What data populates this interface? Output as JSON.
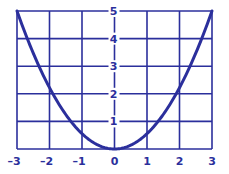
{
  "colors": {
    "ink": "#2b2f9c",
    "background": "#ffffff"
  },
  "chart_data": {
    "type": "line",
    "title": "",
    "xlabel": "",
    "ylabel": "",
    "xlim": [
      -3,
      3
    ],
    "ylim": [
      0,
      5
    ],
    "grid": true,
    "x_ticks": [
      "-3",
      "-2",
      "-1",
      "0",
      "1",
      "2",
      "3"
    ],
    "y_ticks": [
      "1",
      "2",
      "3",
      "4",
      "5"
    ],
    "series": [
      {
        "name": "y = (5/9)x^2",
        "x": [
          -3,
          -2.5,
          -2,
          -1.5,
          -1,
          -0.5,
          0,
          0.5,
          1,
          1.5,
          2,
          2.5,
          3
        ],
        "y": [
          5,
          3.47,
          2.22,
          1.25,
          0.56,
          0.14,
          0,
          0.14,
          0.56,
          1.25,
          2.22,
          3.47,
          5
        ]
      }
    ]
  }
}
